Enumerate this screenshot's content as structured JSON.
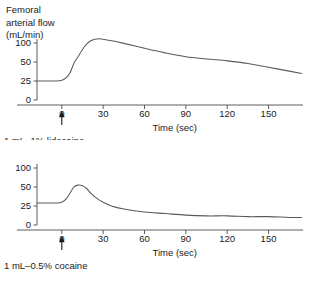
{
  "figure": {
    "yaxis_title_lines": [
      "Femoral",
      "arterial flow",
      "(mL/min)"
    ]
  },
  "chart_data": [
    {
      "type": "line",
      "panel": "top",
      "title": "",
      "xlabel": "Time (sec)",
      "ylabel": "Femoral arterial flow (mL/min)",
      "annotation": "1 mL–1% lidocaine",
      "annotation_marker": "up-arrow at t = 0",
      "grid": false,
      "legend": "none",
      "xlim": [
        -18,
        175
      ],
      "ylim": [
        0,
        100
      ],
      "xticks": [
        0,
        30,
        60,
        90,
        120,
        150
      ],
      "xtick_labels": [
        "0",
        "30",
        "60",
        "90",
        "120",
        "150"
      ],
      "yticks": [
        0,
        25,
        50,
        100
      ],
      "ytick_labels": [
        "0",
        "25",
        "50",
        "100"
      ],
      "yscale_note": "compressed axis: 0-25-50-100 drawn at equal spacing",
      "x": [
        -18,
        -10,
        -4,
        0,
        3,
        6,
        9,
        12,
        15,
        18,
        21,
        24,
        27,
        30,
        36,
        45,
        60,
        75,
        90,
        105,
        120,
        135,
        150,
        165,
        174
      ],
      "y": [
        25,
        25,
        25,
        26,
        29,
        36,
        49,
        65,
        83,
        97,
        106,
        110,
        111,
        110,
        106,
        99,
        86,
        74,
        64,
        58,
        53,
        48,
        43,
        38,
        35
      ]
    },
    {
      "type": "line",
      "panel": "bottom",
      "title": "",
      "xlabel": "Time (sec)",
      "ylabel": "Femoral arterial flow (mL/min)",
      "annotation": "1 mL–0.5% cocaine",
      "annotation_marker": "up-arrow at t = 0",
      "grid": false,
      "legend": "none",
      "xlim": [
        -18,
        175
      ],
      "ylim": [
        0,
        100
      ],
      "xticks": [
        0,
        30,
        60,
        90,
        120,
        150
      ],
      "xtick_labels": [
        "0",
        "30",
        "60",
        "90",
        "120",
        "150"
      ],
      "yticks": [
        0,
        25,
        50,
        100
      ],
      "ytick_labels": [
        "0",
        "25",
        "50",
        "100"
      ],
      "yscale_note": "compressed axis: 0-25-50-100 drawn at equal spacing",
      "x": [
        -18,
        -10,
        -4,
        0,
        3,
        6,
        9,
        12,
        15,
        18,
        21,
        24,
        27,
        30,
        36,
        45,
        60,
        75,
        90,
        105,
        120,
        135,
        150,
        165,
        174
      ],
      "y": [
        29,
        29,
        29,
        30,
        34,
        42,
        51,
        55,
        53,
        48,
        42,
        37,
        33,
        30,
        25,
        21,
        17,
        15,
        13,
        12,
        12,
        11,
        11,
        10,
        10
      ]
    }
  ]
}
